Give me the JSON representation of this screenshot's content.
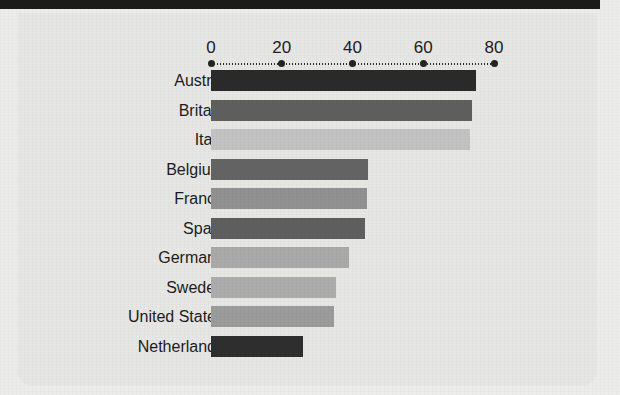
{
  "page": {
    "top_bar_color": "#1b1b1b",
    "panel_background": "#e6e6e4",
    "page_background": "#ececeb"
  },
  "ghost_text": [
    {
      "text": "the Neth",
      "x": 30,
      "y": 52
    },
    {
      "text": "in illus",
      "x": 118,
      "y": 50
    },
    {
      "text": "urian",
      "x": 395,
      "y": 52
    },
    {
      "text": "uster",
      "x": 40,
      "y": 96
    },
    {
      "text": "mulo",
      "x": 150,
      "y": 94
    },
    {
      "text": "ntaler",
      "x": 400,
      "y": 95
    },
    {
      "text": "mue",
      "x": 55,
      "y": 150
    },
    {
      "text": "lation",
      "x": 210,
      "y": 148
    },
    {
      "text": "ian und rier",
      "x": 400,
      "y": 152
    },
    {
      "text": "lastn",
      "x": 60,
      "y": 200
    },
    {
      "text": "rgaliche",
      "x": 460,
      "y": 250
    },
    {
      "text": "onlu in lather",
      "x": 455,
      "y": 272
    },
    {
      "text": "bis one",
      "x": 470,
      "y": 292
    },
    {
      "text": "bresser",
      "x": 60,
      "y": 300
    },
    {
      "text": "eiserb",
      "x": 30,
      "y": 330
    }
  ],
  "chart_data": {
    "type": "bar",
    "orientation": "horizontal",
    "title": "",
    "xlabel": "",
    "ylabel": "",
    "xlim": [
      0,
      80
    ],
    "xticks": [
      0,
      20,
      40,
      60,
      80
    ],
    "xtick_labels": [
      "0",
      "20",
      "40",
      "60",
      "80"
    ],
    "grid": false,
    "legend": "none",
    "categories": [
      "Austria",
      "Britain",
      "Italy",
      "Belgium",
      "France",
      "Spain",
      "Germany",
      "Sweden",
      "United States",
      "Netherlands"
    ],
    "values": [
      75,
      73.7,
      73.2,
      44.5,
      44,
      43.6,
      39,
      35.3,
      34.7,
      26
    ],
    "bar_colors": [
      "#2a2a2a",
      "#5f5f5f",
      "#c2c2c2",
      "#646464",
      "#919191",
      "#5e5e5e",
      "#a9a9a9",
      "#acacac",
      "#9b9b9b",
      "#2e2e2e"
    ]
  }
}
